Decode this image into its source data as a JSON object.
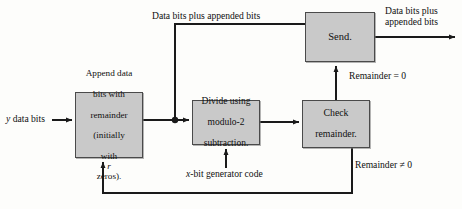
{
  "diagram": {
    "width": 462,
    "height": 209,
    "colors": {
      "node_fill": "#c9c9c9",
      "node_border": "#4a4a4a",
      "wire": "#1a1a1a",
      "background": "#fdfdfb",
      "text": "#101010"
    },
    "nodes": [
      {
        "id": "send",
        "label": "Send.",
        "x": 305,
        "y": 12,
        "w": 70,
        "h": 50
      },
      {
        "id": "append",
        "label": "Append data bits with remainder (initially with r zeros).",
        "x": 75,
        "y": 92,
        "w": 68,
        "h": 66
      },
      {
        "id": "divide",
        "label": "Divide using modulo-2 subtraction.",
        "x": 192,
        "y": 100,
        "w": 68,
        "h": 45
      },
      {
        "id": "check",
        "label": "Check remainder.",
        "x": 302,
        "y": 100,
        "w": 68,
        "h": 48
      }
    ],
    "node_text": {
      "send": "Send.",
      "append_l1": "Append data",
      "append_l2": "bits with",
      "append_l3": "remainder",
      "append_l4": "(initially",
      "append_l5a": "with ",
      "append_l5b": "r",
      "append_l5c": " zeros).",
      "divide_l1": "Divide using",
      "divide_l2": "modulo-2",
      "divide_l3": "subtraction.",
      "check_l1": "Check",
      "check_l2": "remainder."
    },
    "labels": {
      "top_path": "Data bits plus appended bits",
      "output_l1": "Data bits plus",
      "output_l2": "appended bits",
      "input_italic": "y",
      "input_rest": " data bits",
      "remainder_zero": "Remainder = 0",
      "remainder_nonzero": "Remainder ≠ 0",
      "generator_italic": "x",
      "generator_rest": "-bit generator code"
    },
    "edges": [
      {
        "id": "input-to-append",
        "from": "y data bits",
        "to": "append",
        "arrow": true
      },
      {
        "id": "append-to-divide",
        "from": "append",
        "to": "divide",
        "arrow": true
      },
      {
        "id": "junction-to-send",
        "from": "junction",
        "to": "send",
        "arrow": false,
        "label": "Data bits plus appended bits"
      },
      {
        "id": "divide-to-check",
        "from": "divide",
        "to": "check",
        "arrow": true
      },
      {
        "id": "check-to-send",
        "from": "check",
        "to": "send",
        "arrow": true,
        "label": "Remainder = 0"
      },
      {
        "id": "send-to-output",
        "from": "send",
        "to": "output",
        "arrow": true,
        "label": "Data bits plus appended bits"
      },
      {
        "id": "check-to-append-feedback",
        "from": "check",
        "to": "append",
        "arrow": true,
        "label": "Remainder ≠ 0"
      },
      {
        "id": "generator-to-divide",
        "from": "x-bit generator code",
        "to": "divide",
        "arrow": true
      }
    ],
    "junction": {
      "x": 175,
      "y": 120,
      "r": 3
    }
  }
}
